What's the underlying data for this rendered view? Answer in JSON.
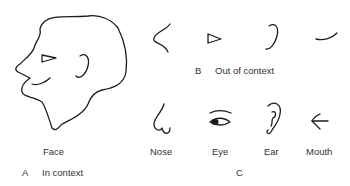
{
  "panels": {
    "A": {
      "letter": "A",
      "caption": "In context",
      "figure_label": "Face"
    },
    "B": {
      "letter": "B",
      "caption": "Out of context",
      "items": [
        "nose-line",
        "eye-triangle",
        "ear-curve",
        "mouth-curve"
      ]
    },
    "C": {
      "letter": "C",
      "items": [
        {
          "label": "Nose"
        },
        {
          "label": "Eye"
        },
        {
          "label": "Ear"
        },
        {
          "label": "Mouth"
        }
      ]
    }
  },
  "colors": {
    "background": "#ffffff",
    "ink": "#1c1c1c",
    "text": "#333333"
  }
}
